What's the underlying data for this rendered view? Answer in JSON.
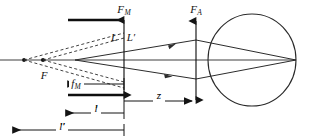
{
  "figure": {
    "kind": "optical-ray-diagram",
    "width": 309,
    "height": 139,
    "background_color": "#ffffff",
    "line_color": "#141414",
    "ray_color": "#3a3a3a"
  },
  "labels": {
    "f_m_plane": {
      "base": "F",
      "sub": "M",
      "x": 124,
      "y": 13
    },
    "f_a_plane": {
      "base": "F",
      "sub": "A",
      "x": 196,
      "y": 13
    },
    "l_left": {
      "base": "L",
      "sub": "",
      "x": 114,
      "y": 41
    },
    "l_prime": {
      "base": "L",
      "sub": "",
      "prime": "′",
      "x": 131,
      "y": 41
    },
    "focal_f": {
      "base": "F",
      "sub": "",
      "x": 44,
      "y": 79
    },
    "f_m_dim": {
      "base": "f",
      "sub": "M",
      "x": 76,
      "y": 87
    },
    "z_dim": {
      "base": "z",
      "sub": "",
      "x": 159,
      "y": 99
    },
    "l_dim": {
      "base": "l",
      "sub": "",
      "x": 96,
      "y": 113
    },
    "l_prime_dim": {
      "base": "l",
      "sub": "",
      "prime": "′",
      "x": 62,
      "y": 131
    }
  },
  "dimensions": {
    "f_m": {
      "label": "f_M",
      "arrow_direction": "left",
      "x_start": 124,
      "x_end": 43,
      "y": 84
    },
    "z": {
      "label": "z",
      "arrow_direction": "right",
      "x_start": 124,
      "x_end": 196,
      "y": 101
    },
    "l": {
      "label": "l",
      "arrow_direction": "left",
      "x_start": 124,
      "x_end": 62,
      "y": 113
    },
    "l_prime": {
      "label": "l′",
      "arrow_direction": "left",
      "x_start": 124,
      "x_end": 9,
      "y": 130
    }
  },
  "optics": {
    "axis": {
      "y": 60,
      "x_start": 0,
      "x_end": 296
    },
    "mirror_plane_x": 124,
    "lens_plane_x": 196,
    "object_vertex": {
      "x": 75,
      "y": 60
    },
    "image_point": {
      "x": 296,
      "y": 60
    },
    "virtual_foci": [
      {
        "x": 24,
        "y": 60
      },
      {
        "x": 43,
        "y": 60
      }
    ],
    "eye": {
      "cx": 252,
      "cy": 60,
      "rx": 44,
      "ry": 46
    },
    "mirror_bar_top": {
      "x_start": 68,
      "x_end": 124,
      "y": 20
    },
    "mirror_bar_bottom": {
      "x_start": 68,
      "x_end": 124,
      "y": 95
    }
  }
}
